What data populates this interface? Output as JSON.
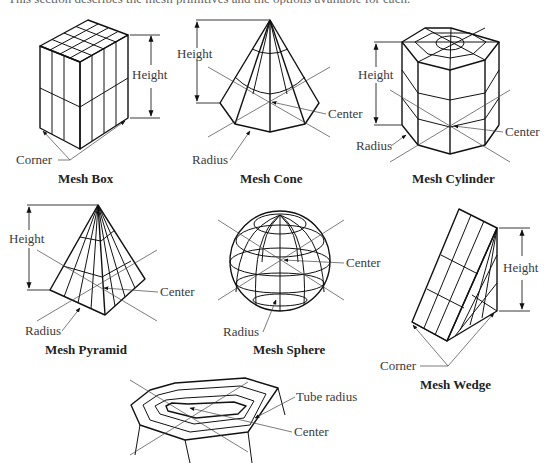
{
  "figure": {
    "top_text_cut": "This section describes the mesh primitives and the options available for each.",
    "panels": [
      {
        "id": "box",
        "caption": "Mesh Box",
        "labels": {
          "height": "Height",
          "corner": "Corner"
        }
      },
      {
        "id": "cone",
        "caption": "Mesh Cone",
        "labels": {
          "height": "Height",
          "center": "Center",
          "radius": "Radius"
        }
      },
      {
        "id": "cylinder",
        "caption": "Mesh Cylinder",
        "labels": {
          "height": "Height",
          "center": "Center",
          "radius": "Radius"
        }
      },
      {
        "id": "pyramid",
        "caption": "Mesh Pyramid",
        "labels": {
          "height": "Height",
          "center": "Center",
          "radius": "Radius"
        }
      },
      {
        "id": "sphere",
        "caption": "Mesh Sphere",
        "labels": {
          "center": "Center",
          "radius": "Radius"
        }
      },
      {
        "id": "wedge",
        "caption": "Mesh Wedge",
        "labels": {
          "height": "Height",
          "corner": "Corner"
        }
      },
      {
        "id": "torus",
        "caption": "",
        "labels": {
          "tube_radius": "Tube radius",
          "center": "Center"
        }
      }
    ]
  }
}
